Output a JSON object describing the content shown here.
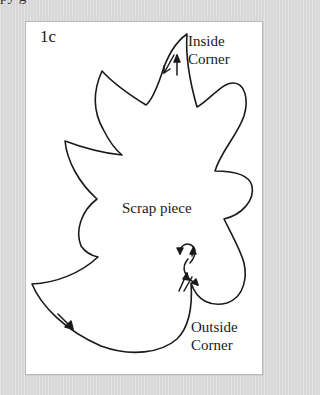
{
  "page": {
    "top_cut_text": "py     g"
  },
  "figure": {
    "label": "1c",
    "scrap_label": "Scrap piece",
    "inside_corner": {
      "line1": "Inside",
      "line2": "Corner"
    },
    "outside_corner": {
      "line1": "Outside",
      "line2": "Corner"
    },
    "colors": {
      "page_background": "#dedede",
      "panel_background": "#ffffff",
      "stroke": "#1a1a1a"
    },
    "arrows": [
      {
        "name": "inside-corner-down-arrow",
        "direction": "down-left"
      },
      {
        "name": "inside-corner-up-arrow",
        "direction": "up"
      },
      {
        "name": "bottom-cut-arrow",
        "direction": "down-right"
      },
      {
        "name": "outside-corner-loop-arrows",
        "direction": "loop"
      }
    ]
  }
}
